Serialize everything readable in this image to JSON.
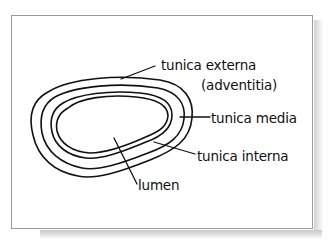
{
  "figure": {
    "type": "hand-drawn cross-section diagram"
  },
  "labels": {
    "tunica_externa": "tunica externa",
    "adventitia": "(adventitia)",
    "tunica_media": "tunica media",
    "tunica_interna": "tunica interna",
    "lumen": "lumen"
  },
  "colors": {
    "ink": "#111111",
    "frame_border": "#9a9a9a",
    "background": "#ffffff",
    "shadow": "#c9c9c9"
  }
}
